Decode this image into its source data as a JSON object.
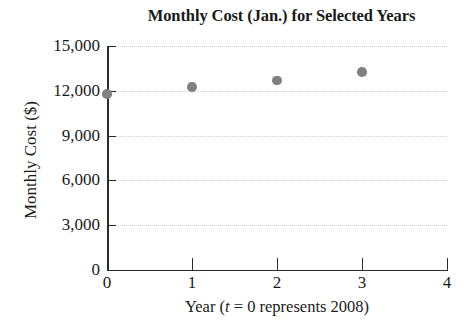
{
  "chart_data": {
    "type": "scatter",
    "title": "Monthly Cost (Jan.) for Selected Years",
    "xlabel_parts": {
      "prefix": "Year (",
      "variable": "t",
      "suffix": " = 0 represents 2008)"
    },
    "xlabel": "Year (t = 0 represents 2008)",
    "ylabel": "Monthly Cost ($)",
    "x": [
      0,
      1,
      2,
      3
    ],
    "values": [
      11800,
      12250,
      12700,
      13250
    ],
    "xlim": [
      0,
      4
    ],
    "ylim": [
      0,
      15000
    ],
    "xticks": [
      "0",
      "1",
      "2",
      "3",
      "4"
    ],
    "xtick_values": [
      0,
      1,
      2,
      3,
      4
    ],
    "yticks": [
      "0",
      "3,000",
      "6,000",
      "9,000",
      "12,000",
      "15,000"
    ],
    "ytick_values": [
      0,
      3000,
      6000,
      9000,
      12000,
      15000
    ],
    "grid": true,
    "grid_axis": "y",
    "legend": false,
    "marker_color": "#808080",
    "axis_color": "#2b2b2b",
    "grid_color": "#cfcfcf"
  }
}
